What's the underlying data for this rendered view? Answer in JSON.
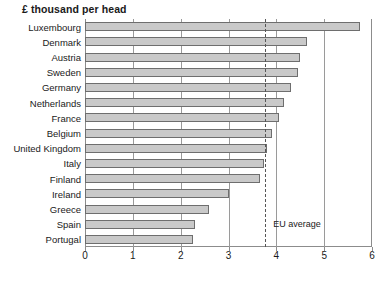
{
  "chart_data": {
    "type": "bar",
    "orientation": "horizontal",
    "title": "£ thousand per head",
    "xlabel": "",
    "ylabel": "",
    "xlim": [
      0,
      6
    ],
    "xticks": [
      0,
      1,
      2,
      3,
      4,
      5,
      6
    ],
    "xtick_labels": [
      "0",
      "1",
      "2",
      "3",
      "4",
      "5",
      "6"
    ],
    "grid": true,
    "grid_axis": "x",
    "legend": null,
    "categories": [
      "Luxembourg",
      "Denmark",
      "Austria",
      "Sweden",
      "Germany",
      "Netherlands",
      "France",
      "Belgium",
      "United Kingdom",
      "Italy",
      "Finland",
      "Ireland",
      "Greece",
      "Spain",
      "Portugal"
    ],
    "values": [
      5.75,
      4.65,
      4.5,
      4.45,
      4.3,
      4.15,
      4.05,
      3.9,
      3.8,
      3.75,
      3.65,
      3.0,
      2.6,
      2.3,
      2.25
    ],
    "annotations": [
      {
        "name": "eu-average",
        "label": "EU average",
        "value": 3.77,
        "style": "dashed-vertical-line"
      }
    ],
    "colors": {
      "bar_fill": "#c9c9c9",
      "bar_border": "#6e6e6e",
      "axis": "#8c8c8c",
      "grid": "#9a9a9a",
      "text": "#1a1a1a",
      "background": "#ffffff"
    }
  }
}
